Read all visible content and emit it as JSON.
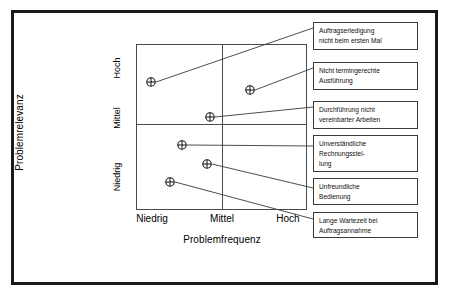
{
  "chart_data": {
    "type": "scatter",
    "title": "",
    "xlabel": "Problemfrequenz",
    "ylabel": "Problemrelevanz",
    "x_ticks": [
      "Niedrig",
      "Mittel",
      "Hoch"
    ],
    "y_ticks": [
      "Niedrig",
      "Mittel",
      "Hoch"
    ],
    "grid": true,
    "legend": "none",
    "marker": "circle-crosshair",
    "xlim": [
      0,
      1
    ],
    "ylim": [
      0,
      1
    ],
    "points": [
      {
        "label": "Auftragserledigung nicht beim ersten Mal",
        "label_lines": [
          "Auftragserledigung",
          "nicht beim ersten Mal"
        ],
        "x": "Niedrig",
        "y": "Hoch",
        "px": 151,
        "py": 82,
        "box": {
          "x": 313,
          "y": 22,
          "w": 105,
          "h": 28
        },
        "leader_to": {
          "x": 313,
          "y": 28
        }
      },
      {
        "label": "Nicht termingerechte Ausführung",
        "label_lines": [
          "Nicht termingerechte",
          "Ausführung"
        ],
        "x": "Hoch",
        "y": "Hoch",
        "px": 250,
        "py": 90,
        "box": {
          "x": 313,
          "y": 62,
          "w": 105,
          "h": 28
        },
        "leader_to": {
          "x": 313,
          "y": 68
        }
      },
      {
        "label": "Durchführung nicht vereinbarter Arbeiten",
        "label_lines": [
          "Durchführung nicht",
          "vereinbarter Arbeiten"
        ],
        "x": "Mittel",
        "y": "Mittel",
        "px": 210,
        "py": 117,
        "box": {
          "x": 313,
          "y": 101,
          "w": 105,
          "h": 28
        },
        "leader_to": {
          "x": 313,
          "y": 107
        }
      },
      {
        "label": "Unverständliche Rechnungsstellung",
        "label_lines": [
          "Unverständliche",
          "Rechnungsstel-",
          "lung"
        ],
        "x": "Niedrig",
        "y": "Niedrig",
        "px": 182,
        "py": 145,
        "box": {
          "x": 313,
          "y": 135,
          "w": 105,
          "h": 37
        },
        "leader_to": {
          "x": 313,
          "y": 146
        }
      },
      {
        "label": "Unfreundliche Bedienung",
        "label_lines": [
          "Unfreundliche",
          "Bedienung"
        ],
        "x": "Mittel",
        "y": "Niedrig",
        "px": 207,
        "py": 164,
        "box": {
          "x": 313,
          "y": 178,
          "w": 105,
          "h": 27
        },
        "leader_to": {
          "x": 313,
          "y": 188
        }
      },
      {
        "label": "Lange Wartezeit bei Auftragsannahme",
        "label_lines": [
          "Lange Wartezeit bei",
          "Auftragsannahme"
        ],
        "x": "Niedrig",
        "y": "Niedrig",
        "px": 170,
        "py": 182,
        "box": {
          "x": 313,
          "y": 212,
          "w": 105,
          "h": 26
        },
        "leader_to": {
          "x": 313,
          "y": 219
        }
      }
    ]
  },
  "axes": {
    "x_title": "Problemfrequenz",
    "y_title": "Problemrelevanz",
    "x_tick_0": "Niedrig",
    "x_tick_1": "Mittel",
    "x_tick_2": "Hoch",
    "y_tick_0": "Niedrig",
    "y_tick_1": "Mittel",
    "y_tick_2": "Hoch"
  },
  "colors": {
    "border": "#1a1a1a",
    "plot_line": "#4a4a4a",
    "leader_line": "#3a3a3a",
    "box_border": "#3a3a3a",
    "text": "#111111",
    "background": "#ffffff"
  }
}
